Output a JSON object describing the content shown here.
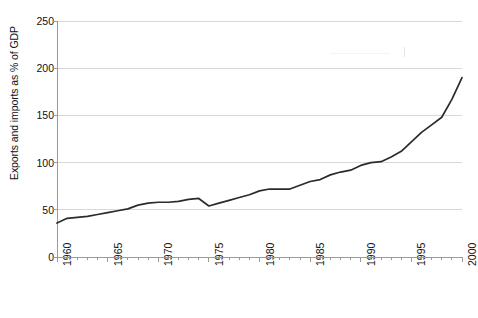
{
  "chart_data": {
    "type": "line",
    "title": "",
    "xlabel": "",
    "ylabel": "Exports and imports as % of GDP",
    "xlim": [
      1960,
      2000
    ],
    "ylim": [
      0,
      250
    ],
    "grid": true,
    "legend": "none",
    "y_ticks": [
      0,
      50,
      100,
      150,
      200,
      250
    ],
    "y_tick_labels": [
      "0",
      "50",
      "100",
      "150",
      "200",
      "250"
    ],
    "x_ticks": [
      1960,
      1965,
      1970,
      1975,
      1980,
      1985,
      1990,
      1995,
      2000
    ],
    "x_tick_labels": [
      "1960",
      "1965",
      "1970",
      "1975",
      "1980",
      "1985",
      "1990",
      "1995",
      "2000"
    ],
    "x_minor_tick_interval": 1,
    "line_color": "#2b2b2b",
    "grid_color": "#d8d8d8",
    "axis_color": "#9a9a9a",
    "series": [
      {
        "name": "Exports and imports as % of GDP",
        "x": [
          1960,
          1961,
          1962,
          1963,
          1964,
          1965,
          1966,
          1967,
          1968,
          1969,
          1970,
          1971,
          1972,
          1973,
          1974,
          1975,
          1976,
          1977,
          1978,
          1979,
          1980,
          1981,
          1982,
          1983,
          1984,
          1985,
          1986,
          1987,
          1988,
          1989,
          1990,
          1991,
          1992,
          1993,
          1994,
          1995,
          1996,
          1997,
          1998,
          1999,
          2000
        ],
        "values": [
          36,
          41,
          42,
          43,
          45,
          47,
          49,
          51,
          55,
          57,
          58,
          58,
          59,
          61,
          62,
          54,
          57,
          60,
          63,
          66,
          70,
          72,
          72,
          72,
          76,
          80,
          82,
          87,
          90,
          92,
          97,
          100,
          101,
          106,
          112,
          122,
          132,
          140,
          148,
          167,
          190
        ]
      }
    ]
  }
}
